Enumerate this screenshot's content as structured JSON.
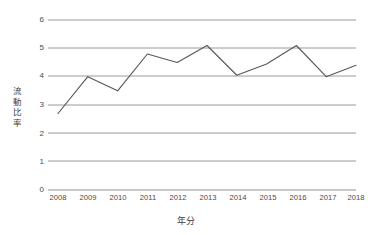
{
  "chart_data": {
    "type": "line",
    "title": "",
    "subtitle": "",
    "xlabel": "年分",
    "ylabel": "流動比率",
    "ylabel_chars": [
      "流",
      "動",
      "比",
      "率"
    ],
    "categories": [
      "2008",
      "2009",
      "2010",
      "2011",
      "2012",
      "2013",
      "2014",
      "2015",
      "2016",
      "2017",
      "2018"
    ],
    "values": [
      2.7,
      4.0,
      3.5,
      4.8,
      4.5,
      5.1,
      4.05,
      4.45,
      5.1,
      4.0,
      4.4
    ],
    "series": [
      {
        "name": "流動比率",
        "values": [
          2.7,
          4.0,
          3.5,
          4.8,
          4.5,
          5.1,
          4.05,
          4.45,
          5.1,
          4.0,
          4.4
        ]
      }
    ],
    "yticks": [
      "6",
      "5",
      "4",
      "3",
      "2",
      "1",
      "0"
    ],
    "ytick_values": [
      6,
      5,
      4,
      3,
      2,
      1,
      0
    ],
    "ylim": [
      0,
      6
    ],
    "grid": "horizontal",
    "legend": "none",
    "line_color": "#595959",
    "grid_color": "#9a9a9a",
    "markers": "none"
  }
}
